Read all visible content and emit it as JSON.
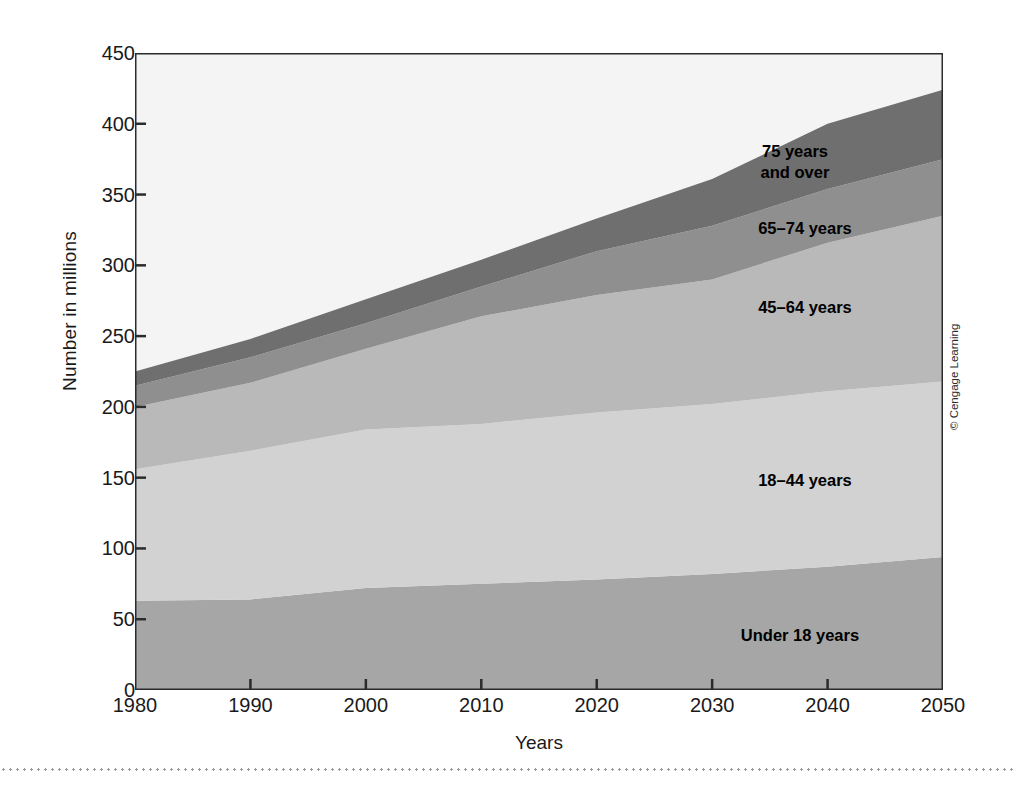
{
  "figure": {
    "copyright": "© Cengage Learning"
  },
  "chart_data": {
    "type": "area",
    "title": "",
    "xlabel": "Years",
    "ylabel": "Number in millions",
    "xlim": [
      1980,
      2050
    ],
    "ylim": [
      0,
      450
    ],
    "grid": false,
    "legend_position": "inline-annotations",
    "stacked": true,
    "x": [
      1980,
      1990,
      2000,
      2010,
      2020,
      2030,
      2040,
      2050
    ],
    "xticks": [
      "1980",
      "1990",
      "2000",
      "2010",
      "2020",
      "2030",
      "2040",
      "2050"
    ],
    "yticks": [
      "0",
      "50",
      "100",
      "150",
      "200",
      "250",
      "300",
      "350",
      "400",
      "450"
    ],
    "series": [
      {
        "name": "Under 18 years",
        "label": "Under 18 years",
        "color": "#a6a6a6",
        "values": [
          63,
          64,
          72,
          75,
          78,
          82,
          87,
          94
        ]
      },
      {
        "name": "18–44 years",
        "label": "18–44 years",
        "color": "#d2d2d2",
        "values": [
          93,
          105,
          112,
          113,
          118,
          120,
          124,
          124
        ]
      },
      {
        "name": "45–64 years",
        "label": "45–64 years",
        "color": "#b9b9b9",
        "values": [
          44,
          48,
          57,
          76,
          83,
          88,
          105,
          117
        ]
      },
      {
        "name": "65–74 years",
        "label": "65–74 years",
        "color": "#8f8f8f",
        "values": [
          15,
          18,
          18,
          21,
          31,
          38,
          38,
          40
        ]
      },
      {
        "name": "75 years and over",
        "label": "75 years\nand over",
        "color": "#6f6f6f",
        "values": [
          10,
          13,
          17,
          19,
          23,
          33,
          46,
          49
        ]
      }
    ],
    "cumulative_tops": {
      "1980": [
        63,
        156,
        200,
        215,
        225
      ],
      "1990": [
        64,
        169,
        217,
        235,
        248
      ],
      "2000": [
        72,
        184,
        241,
        259,
        276
      ],
      "2010": [
        75,
        188,
        264,
        285,
        304
      ],
      "2020": [
        78,
        196,
        279,
        310,
        333
      ],
      "2030": [
        82,
        202,
        290,
        328,
        361
      ],
      "2040": [
        87,
        211,
        316,
        354,
        400
      ],
      "2050": [
        94,
        218,
        335,
        375,
        424
      ]
    },
    "plot_background": "#f4f4f4",
    "axis_color": "#2b2b2b"
  }
}
